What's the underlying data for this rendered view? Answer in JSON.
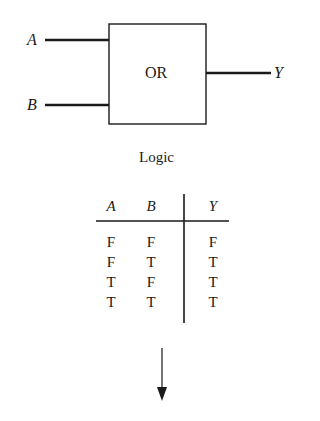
{
  "gate": {
    "type_label": "OR",
    "inputs": [
      {
        "name": "A"
      },
      {
        "name": "B"
      }
    ],
    "output": {
      "name": "Y"
    }
  },
  "caption": "Logic",
  "truth_table": {
    "headers": [
      "A",
      "B",
      "Y"
    ],
    "rows": [
      [
        "F",
        "F",
        "F"
      ],
      [
        "F",
        "T",
        "T"
      ],
      [
        "T",
        "F",
        "T"
      ],
      [
        "T",
        "T",
        "T"
      ]
    ]
  },
  "arrow": {
    "direction": "down"
  }
}
